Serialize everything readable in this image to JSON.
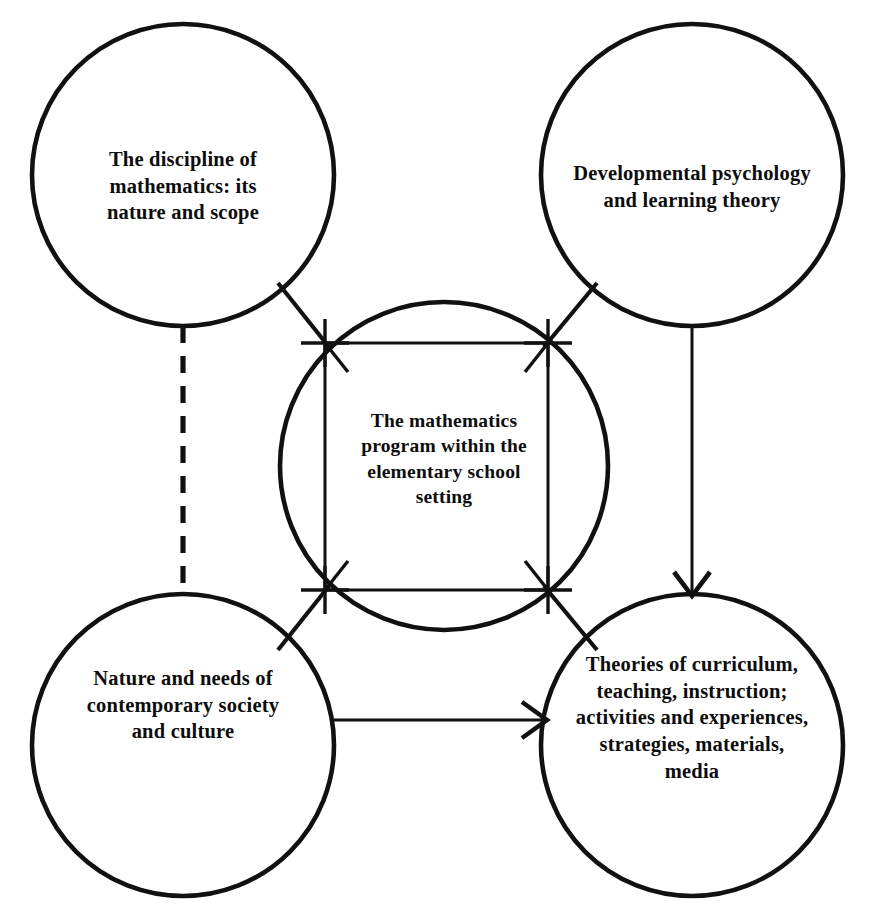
{
  "diagram": {
    "type": "concept-diagram",
    "title": "The mathematics program within the elementary school setting",
    "stroke_color": "#111111",
    "background_color": "#ffffff",
    "nodes": [
      {
        "id": "discipline-of-mathematics",
        "position": "top-left",
        "shape": "circle",
        "label": "The discipline of\nmathematics: its\nnature and scope"
      },
      {
        "id": "developmental-psychology",
        "position": "top-right",
        "shape": "circle",
        "label": "Developmental psychology\nand learning theory"
      },
      {
        "id": "contemporary-society",
        "position": "bottom-left",
        "shape": "circle",
        "label": "Nature and needs of\ncontemporary society\nand culture"
      },
      {
        "id": "theories-of-curriculum",
        "position": "bottom-right",
        "shape": "circle",
        "label": "Theories of curriculum,\nteaching, instruction;\nactivities and experiences,\nstrategies, materials,\nmedia"
      },
      {
        "id": "mathematics-program",
        "position": "center",
        "shape": "circle-with-inscribed-square",
        "label": "The mathematics\nprogram within the\nelementary school\nsetting"
      }
    ],
    "connectors": [
      {
        "id": "discipline-to-center",
        "from": "discipline-of-mathematics",
        "to": "mathematics-program",
        "style": "solid",
        "arrow": "to-center"
      },
      {
        "id": "psychology-to-center",
        "from": "developmental-psychology",
        "to": "mathematics-program",
        "style": "solid",
        "arrow": "to-center"
      },
      {
        "id": "society-to-center",
        "from": "contemporary-society",
        "to": "mathematics-program",
        "style": "solid",
        "arrow": "to-center"
      },
      {
        "id": "curriculum-to-center",
        "from": "theories-of-curriculum",
        "to": "mathematics-program",
        "style": "solid",
        "arrow": "to-center"
      },
      {
        "id": "discipline-to-society",
        "from": "discipline-of-mathematics",
        "to": "contemporary-society",
        "style": "dashed",
        "arrow": "none"
      },
      {
        "id": "psychology-to-curriculum",
        "from": "developmental-psychology",
        "to": "theories-of-curriculum",
        "style": "solid",
        "arrow": "down"
      },
      {
        "id": "society-to-curriculum",
        "from": "contemporary-society",
        "to": "theories-of-curriculum",
        "style": "solid",
        "arrow": "right"
      }
    ]
  }
}
